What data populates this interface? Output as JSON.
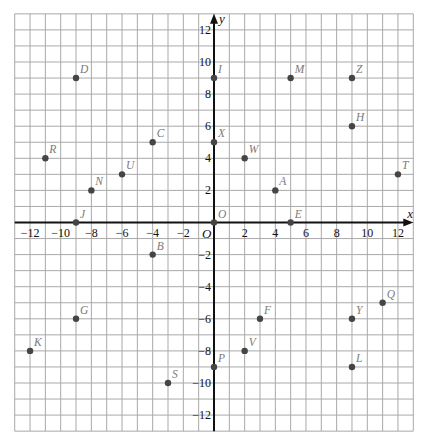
{
  "chart_data": {
    "type": "scatter",
    "title": "",
    "xlabel": "x",
    "ylabel": "y",
    "origin_label": "O",
    "xlim": [
      -13,
      13
    ],
    "ylim": [
      -13,
      13
    ],
    "grid": true,
    "grid_step": 1,
    "x_ticks": [
      -12,
      -10,
      -8,
      -6,
      -4,
      -2,
      2,
      4,
      6,
      8,
      10,
      12
    ],
    "y_ticks": [
      12,
      10,
      8,
      6,
      4,
      2,
      -2,
      -4,
      -6,
      -8,
      -10,
      -12
    ],
    "points": [
      {
        "label": "D",
        "x": -9,
        "y": 9
      },
      {
        "label": "I",
        "x": 0,
        "y": 9
      },
      {
        "label": "M",
        "x": 5,
        "y": 9
      },
      {
        "label": "Z",
        "x": 9,
        "y": 9
      },
      {
        "label": "H",
        "x": 9,
        "y": 6
      },
      {
        "label": "C",
        "x": -4,
        "y": 5
      },
      {
        "label": "X",
        "x": 0,
        "y": 5
      },
      {
        "label": "R",
        "x": -11,
        "y": 4
      },
      {
        "label": "W",
        "x": 2,
        "y": 4
      },
      {
        "label": "U",
        "x": -6,
        "y": 3
      },
      {
        "label": "T",
        "x": 12,
        "y": 3
      },
      {
        "label": "N",
        "x": -8,
        "y": 2
      },
      {
        "label": "A",
        "x": 4,
        "y": 2
      },
      {
        "label": "J",
        "x": -9,
        "y": 0
      },
      {
        "label": "O",
        "x": 0,
        "y": 0
      },
      {
        "label": "E",
        "x": 5,
        "y": 0
      },
      {
        "label": "B",
        "x": -4,
        "y": -2
      },
      {
        "label": "Q",
        "x": 11,
        "y": -5
      },
      {
        "label": "G",
        "x": -9,
        "y": -6
      },
      {
        "label": "F",
        "x": 3,
        "y": -6
      },
      {
        "label": "Y",
        "x": 9,
        "y": -6
      },
      {
        "label": "K",
        "x": -12,
        "y": -8
      },
      {
        "label": "V",
        "x": 2,
        "y": -8
      },
      {
        "label": "P",
        "x": 0,
        "y": -9
      },
      {
        "label": "L",
        "x": 9,
        "y": -9
      },
      {
        "label": "S",
        "x": -3,
        "y": -10
      }
    ]
  },
  "colors": {
    "grid": "#a9a9a9",
    "axis": "#111111",
    "point": "#454545",
    "point_label": "#7a7a7a"
  }
}
